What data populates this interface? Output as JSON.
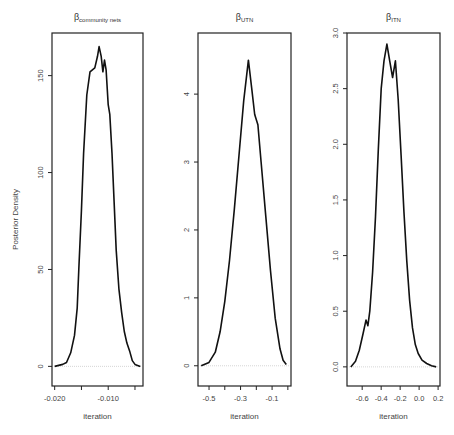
{
  "chart_data": [
    {
      "type": "line",
      "title": "β_community nets",
      "title_main": "β",
      "title_sub": "community nets",
      "xlabel": "iteration",
      "ylabel": "Posterior Density",
      "xlim": [
        -0.0205,
        -0.0035
      ],
      "ylim": [
        -6,
        172
      ],
      "x_ticks": [
        -0.02,
        -0.015,
        -0.01,
        -0.005
      ],
      "x_tick_labels": [
        "-0.020",
        "",
        "-0.010",
        ""
      ],
      "y_ticks": [
        0,
        50,
        100,
        150
      ],
      "y_tick_labels": [
        "0",
        "50",
        "100",
        "150"
      ],
      "grid": false,
      "baseline": 0,
      "x": [
        -0.02,
        -0.0185,
        -0.0178,
        -0.017,
        -0.0163,
        -0.0158,
        -0.0155,
        -0.015,
        -0.0146,
        -0.014,
        -0.0134,
        -0.0125,
        -0.012,
        -0.0117,
        -0.0113,
        -0.011,
        -0.0107,
        -0.0104,
        -0.01,
        -0.0097,
        -0.0093,
        -0.0089,
        -0.0085,
        -0.008,
        -0.0075,
        -0.007,
        -0.0065,
        -0.006,
        -0.0055,
        -0.005,
        -0.0045,
        -0.004
      ],
      "values": [
        0,
        1,
        2,
        7,
        16,
        30,
        50,
        80,
        110,
        140,
        152,
        154,
        160,
        165,
        160,
        152,
        158,
        153,
        135,
        130,
        110,
        85,
        60,
        40,
        28,
        18,
        12,
        8,
        3,
        1,
        0.5,
        0
      ]
    },
    {
      "type": "line",
      "title": "β_UTN",
      "title_main": "β",
      "title_sub": "UTN",
      "xlabel": "iteration",
      "ylabel": "",
      "xlim": [
        -0.57,
        0.02
      ],
      "ylim": [
        -0.18,
        4.9
      ],
      "x_ticks": [
        -0.5,
        -0.4,
        -0.3,
        -0.2,
        -0.1,
        0.0
      ],
      "x_tick_labels": [
        "-0.5",
        "",
        "-0.3",
        "",
        "-0.1",
        ""
      ],
      "y_ticks": [
        0,
        1,
        2,
        3,
        4
      ],
      "y_tick_labels": [
        "0",
        "1",
        "2",
        "3",
        "4"
      ],
      "grid": false,
      "baseline": 0,
      "x": [
        -0.55,
        -0.5,
        -0.46,
        -0.43,
        -0.4,
        -0.37,
        -0.34,
        -0.31,
        -0.28,
        -0.25,
        -0.23,
        -0.21,
        -0.19,
        -0.17,
        -0.14,
        -0.11,
        -0.08,
        -0.05,
        -0.03,
        -0.01
      ],
      "values": [
        0,
        0.05,
        0.2,
        0.5,
        0.95,
        1.55,
        2.3,
        3.1,
        3.9,
        4.5,
        4.1,
        3.7,
        3.55,
        3.0,
        2.2,
        1.4,
        0.7,
        0.25,
        0.08,
        0.02
      ]
    },
    {
      "type": "line",
      "title": "β_ITN",
      "title_main": "β",
      "title_sub": "ITN",
      "xlabel": "iteration",
      "ylabel": "",
      "xlim": [
        -0.76,
        0.22
      ],
      "ylim": [
        -0.1,
        3.0
      ],
      "x_ticks": [
        -0.6,
        -0.4,
        -0.2,
        0.0,
        0.2
      ],
      "x_tick_labels": [
        "-0.6",
        "-0.4",
        "-0.2",
        "0.0",
        "0.2"
      ],
      "y_ticks": [
        0.0,
        0.5,
        1.0,
        1.5,
        2.0,
        2.5,
        3.0
      ],
      "y_tick_labels": [
        "0.0",
        "0.5",
        "1.0",
        "1.5",
        "2.0",
        "2.5",
        "3.0"
      ],
      "grid": false,
      "baseline": 0,
      "x": [
        -0.72,
        -0.67,
        -0.63,
        -0.59,
        -0.56,
        -0.54,
        -0.52,
        -0.49,
        -0.46,
        -0.43,
        -0.4,
        -0.37,
        -0.34,
        -0.31,
        -0.28,
        -0.25,
        -0.22,
        -0.19,
        -0.16,
        -0.13,
        -0.1,
        -0.07,
        -0.04,
        -0.01,
        0.03,
        0.08,
        0.13,
        0.18
      ],
      "values": [
        0,
        0.05,
        0.15,
        0.3,
        0.42,
        0.37,
        0.5,
        0.85,
        1.35,
        1.95,
        2.5,
        2.75,
        2.9,
        2.75,
        2.6,
        2.75,
        2.4,
        1.9,
        1.4,
        0.95,
        0.6,
        0.35,
        0.2,
        0.12,
        0.06,
        0.03,
        0.01,
        0.0
      ]
    }
  ]
}
